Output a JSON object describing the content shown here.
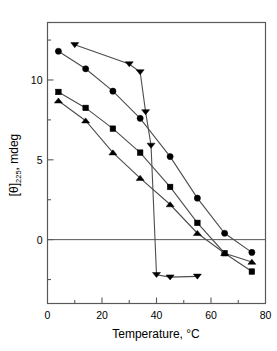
{
  "chart_data": {
    "type": "line",
    "title": "",
    "xlabel": "Temperature, °C",
    "ylabel_prefix": "[θ]",
    "ylabel_sub": "225",
    "ylabel_suffix": ", mdeg",
    "xlim": [
      0,
      80
    ],
    "ylim": [
      -4,
      13.6
    ],
    "xticks": [
      0,
      20,
      40,
      60,
      80
    ],
    "xticklabels": [
      "0",
      "20",
      "40",
      "60",
      "80"
    ],
    "xminorticks": [
      10,
      30,
      50,
      70
    ],
    "yticks": [
      0,
      5,
      10
    ],
    "yticklabels": [
      "0",
      "5",
      "10"
    ],
    "yminorticks": [
      -2.5,
      2.5,
      7.5,
      12.5
    ],
    "grid": false,
    "legend": "none",
    "zero_line": 0,
    "marker_color": "#000000",
    "line_color": "#4d4d4d",
    "axis_color": "#595959",
    "series": [
      {
        "name": "circle",
        "marker": "circle",
        "x": [
          4,
          14,
          24,
          34,
          45,
          55,
          65,
          75
        ],
        "values": [
          11.8,
          10.7,
          9.3,
          7.6,
          5.2,
          2.6,
          0.4,
          -0.8
        ]
      },
      {
        "name": "triangle-down",
        "marker": "triangle-down",
        "x": [
          10,
          30,
          34,
          36,
          38,
          40,
          45,
          55
        ],
        "values": [
          12.2,
          11.0,
          10.5,
          8.0,
          5.9,
          -2.2,
          -2.35,
          -2.3
        ]
      },
      {
        "name": "square",
        "marker": "square",
        "x": [
          4,
          14,
          24,
          34,
          45,
          55,
          65,
          75
        ],
        "values": [
          9.25,
          8.25,
          6.95,
          5.45,
          3.3,
          1.05,
          -0.85,
          -2.0
        ]
      },
      {
        "name": "triangle-up",
        "marker": "triangle-up",
        "x": [
          4,
          14,
          24,
          34,
          45,
          55,
          65,
          75
        ],
        "values": [
          8.7,
          7.45,
          5.45,
          3.85,
          2.2,
          0.4,
          -0.85,
          -1.4
        ]
      }
    ]
  }
}
